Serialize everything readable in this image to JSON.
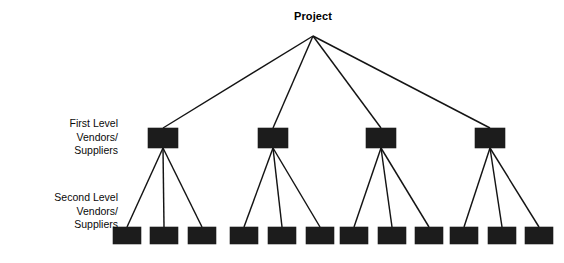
{
  "diagram": {
    "type": "hierarchy-tree",
    "background_color": "#ffffff",
    "node_color": "#1c1c1c",
    "line_color": "#141414",
    "root": {
      "label": "Project",
      "center_x": 313,
      "label_y": 10,
      "apex_x": 313,
      "apex_y": 36
    },
    "level_labels": [
      {
        "name": "first-level-label",
        "lines": [
          "First Level",
          "Vendors/",
          "Suppliers"
        ],
        "right_x": 118,
        "top_y": 117
      },
      {
        "name": "second-level-label",
        "lines": [
          "Second Level",
          "Vendors/",
          "Suppliers"
        ],
        "right_x": 118,
        "top_y": 191
      }
    ],
    "box_size": {
      "level1_w": 30,
      "level1_h": 20,
      "level2_w": 28,
      "level2_h": 17
    },
    "level1_nodes": [
      {
        "id": "l1-1",
        "x": 148,
        "y": 128,
        "w": 30,
        "h": 20
      },
      {
        "id": "l1-2",
        "x": 258,
        "y": 128,
        "w": 30,
        "h": 20
      },
      {
        "id": "l1-3",
        "x": 366,
        "y": 128,
        "w": 30,
        "h": 20
      },
      {
        "id": "l1-4",
        "x": 475,
        "y": 128,
        "w": 30,
        "h": 20
      }
    ],
    "level2_nodes": [
      {
        "id": "l2-1-1",
        "parent": "l1-1",
        "x": 113,
        "y": 227,
        "w": 28,
        "h": 17
      },
      {
        "id": "l2-1-2",
        "parent": "l1-1",
        "x": 150,
        "y": 227,
        "w": 28,
        "h": 17
      },
      {
        "id": "l2-1-3",
        "parent": "l1-1",
        "x": 188,
        "y": 227,
        "w": 28,
        "h": 17
      },
      {
        "id": "l2-2-1",
        "parent": "l1-2",
        "x": 230,
        "y": 227,
        "w": 28,
        "h": 17
      },
      {
        "id": "l2-2-2",
        "parent": "l1-2",
        "x": 268,
        "y": 227,
        "w": 28,
        "h": 17
      },
      {
        "id": "l2-2-3",
        "parent": "l1-2",
        "x": 306,
        "y": 227,
        "w": 28,
        "h": 17
      },
      {
        "id": "l2-3-1",
        "parent": "l1-3",
        "x": 340,
        "y": 227,
        "w": 28,
        "h": 17
      },
      {
        "id": "l2-3-2",
        "parent": "l1-3",
        "x": 378,
        "y": 227,
        "w": 28,
        "h": 17
      },
      {
        "id": "l2-3-3",
        "parent": "l1-3",
        "x": 415,
        "y": 227,
        "w": 28,
        "h": 17
      },
      {
        "id": "l2-4-1",
        "parent": "l1-4",
        "x": 450,
        "y": 227,
        "w": 28,
        "h": 17
      },
      {
        "id": "l2-4-2",
        "parent": "l1-4",
        "x": 488,
        "y": 227,
        "w": 28,
        "h": 17
      },
      {
        "id": "l2-4-3",
        "parent": "l1-4",
        "x": 525,
        "y": 227,
        "w": 28,
        "h": 17
      }
    ],
    "edges_root": [
      {
        "from": "root",
        "to": "l1-1"
      },
      {
        "from": "root",
        "to": "l1-2"
      },
      {
        "from": "root",
        "to": "l1-3"
      },
      {
        "from": "root",
        "to": "l1-4"
      }
    ],
    "edge_count_root": 4,
    "edge_count_level1_to_level2": 12
  }
}
